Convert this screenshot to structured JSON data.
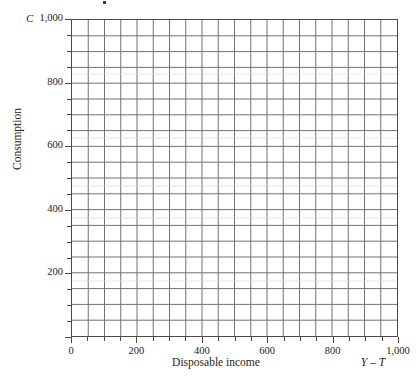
{
  "chart_data": {
    "type": "line",
    "title": "",
    "subtitle": "",
    "xlabel": "Disposable income",
    "ylabel": "Consumption",
    "x_axis_symbol": "Y – T",
    "y_axis_symbol": "C",
    "xlim": [
      0,
      1000
    ],
    "ylim": [
      0,
      1000
    ],
    "xticks": [
      0,
      200,
      400,
      600,
      800,
      1000
    ],
    "yticks": [
      0,
      200,
      400,
      600,
      800,
      1000
    ],
    "xtick_labels": [
      "0",
      "200",
      "400",
      "600",
      "800",
      "1,000"
    ],
    "ytick_labels": [
      "0",
      "200",
      "400",
      "600",
      "800",
      "1,000"
    ],
    "minor_tick_step": 50,
    "grid_columns": 20,
    "grid_rows": 20,
    "grid": true,
    "legend": "none",
    "series": [],
    "annotations": [],
    "note": "Blank graph-paper grid; no data series plotted."
  },
  "axes": {
    "y_symbol": "C",
    "y_title": "Consumption",
    "x_title": "Disposable income",
    "x_symbol": "Y – T",
    "y_tick_labels": [
      {
        "value": 1000,
        "label": "1,000"
      },
      {
        "value": 800,
        "label": "800"
      },
      {
        "value": 600,
        "label": "600"
      },
      {
        "value": 400,
        "label": "400"
      },
      {
        "value": 200,
        "label": "200"
      }
    ],
    "x_tick_labels": [
      {
        "value": 0,
        "label": "0"
      },
      {
        "value": 200,
        "label": "200"
      },
      {
        "value": 400,
        "label": "400"
      },
      {
        "value": 600,
        "label": "600"
      },
      {
        "value": 800,
        "label": "800"
      },
      {
        "value": 1000,
        "label": "1,000"
      }
    ]
  },
  "colors": {
    "background": "#ffffff",
    "grid_line": "#707070",
    "axis_line": "#4a4a4a",
    "text": "#1d1d1d"
  }
}
